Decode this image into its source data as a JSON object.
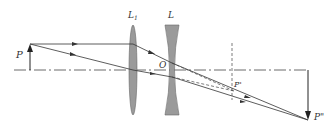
{
  "diagram": {
    "type": "optics-ray-diagram",
    "labels": {
      "object": "P",
      "lens1": "L",
      "lens1_sub": "1",
      "lens2": "L",
      "optical_center": "O",
      "intermediate_image": "P'",
      "final_image": "P\""
    },
    "elements": {
      "lens1_type": "convex",
      "lens2_type": "concave"
    },
    "colors": {
      "line": "#333333",
      "lens_fill": "#9a9a9a",
      "lens_stroke": "#555555"
    }
  }
}
